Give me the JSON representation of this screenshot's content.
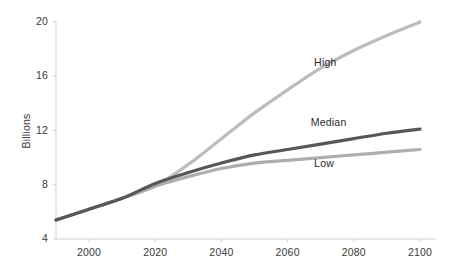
{
  "chart_data": {
    "type": "line",
    "title": "",
    "subtitle": "",
    "xlabel": "",
    "ylabel": "Billions",
    "xlim": [
      1990,
      2100
    ],
    "ylim": [
      4,
      20
    ],
    "grid": false,
    "legend_position": "inline-right-of-series",
    "x_ticks": [
      "2000",
      "2020",
      "2040",
      "2060",
      "2080",
      "2100"
    ],
    "x_tick_values": [
      2000,
      2020,
      2040,
      2060,
      2080,
      2100
    ],
    "y_ticks": [
      "4",
      "8",
      "12",
      "16",
      "20"
    ],
    "y_tick_values": [
      4,
      8,
      12,
      16,
      20
    ],
    "x": [
      1990,
      2000,
      2010,
      2020,
      2030,
      2040,
      2050,
      2060,
      2070,
      2080,
      2090,
      2100
    ],
    "series": [
      {
        "name": "High",
        "color": "#bcbcbc",
        "label": "High",
        "values": [
          5.4,
          6.2,
          7.0,
          7.9,
          9.5,
          11.4,
          13.3,
          15.0,
          16.6,
          17.9,
          19.0,
          20.0
        ]
      },
      {
        "name": "Median",
        "color": "#575757",
        "label": "Median",
        "values": [
          5.4,
          6.2,
          7.0,
          8.1,
          8.9,
          9.6,
          10.2,
          10.6,
          11.0,
          11.4,
          11.8,
          12.1
        ]
      },
      {
        "name": "Low",
        "color": "#aeaeae",
        "label": "Low",
        "values": [
          5.4,
          6.2,
          7.0,
          7.9,
          8.6,
          9.2,
          9.6,
          9.8,
          10.0,
          10.2,
          10.4,
          10.6
        ]
      }
    ],
    "annotations": [
      {
        "text": "High",
        "x": 2068,
        "y": 17.0
      },
      {
        "text": "Median",
        "x": 2067,
        "y": 12.55
      },
      {
        "text": "Low",
        "x": 2068,
        "y": 9.5
      }
    ],
    "axis_color": "#cfcfcf",
    "tick_color": "#cfcfcf",
    "text_color": "#3a3a3a",
    "background": "#ffffff"
  },
  "geometry": {
    "plot_left": 56,
    "plot_right": 420,
    "plot_top": 22,
    "plot_bottom": 239
  }
}
